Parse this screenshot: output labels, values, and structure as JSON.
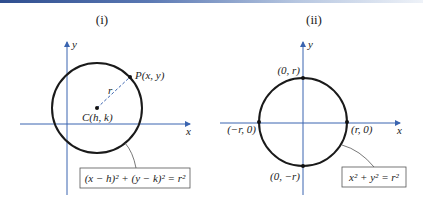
{
  "header": {
    "accent_color": "#2f4e8f"
  },
  "figures": [
    {
      "title": "(i)",
      "axis_x_label": "x",
      "axis_y_label": "y",
      "point_label": "P(x, y)",
      "radius_label": "r",
      "center_label": "C(h, k)",
      "equation": "(x − h)² + (y − k)² = r²"
    },
    {
      "title": "(ii)",
      "axis_x_label": "x",
      "axis_y_label": "y",
      "top_label": "(0, r)",
      "bottom_label": "(0, −r)",
      "left_label": "(−r, 0)",
      "right_label": "(r, 0)",
      "equation": "x² + y² = r²"
    }
  ],
  "colors": {
    "axis": "#3a64b0",
    "circle": "#1a1a1a",
    "box_border": "#555555"
  }
}
